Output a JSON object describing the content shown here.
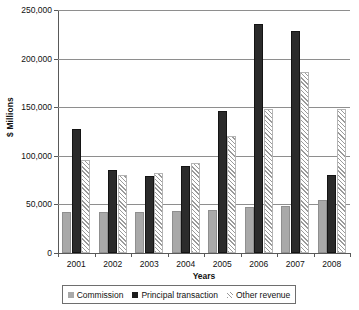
{
  "chart_data": {
    "type": "bar",
    "title": "",
    "xlabel": "Years",
    "ylabel": "$ Millions",
    "categories": [
      "2001",
      "2002",
      "2003",
      "2004",
      "2005",
      "2006",
      "2007",
      "2008"
    ],
    "series": [
      {
        "name": "Commission",
        "color": "#a9a9a9",
        "pattern": "solid-gray",
        "values": [
          42000,
          42000,
          42000,
          43000,
          44000,
          47000,
          48000,
          55000
        ]
      },
      {
        "name": "Principal transaction",
        "color": "#2b2b2b",
        "pattern": "solid-black",
        "values": [
          128000,
          85000,
          79000,
          90000,
          146000,
          236000,
          228000,
          80000
        ]
      },
      {
        "name": "Other revenue",
        "color": "#9a9a9a",
        "pattern": "diagonal-hatch",
        "values": [
          96000,
          80000,
          82000,
          93000,
          120000,
          148000,
          186000,
          148000
        ]
      }
    ],
    "ylim": [
      0,
      250000
    ],
    "ytick_values": [
      0,
      50000,
      100000,
      150000,
      200000,
      250000
    ],
    "ytick_labels": [
      "0",
      "50,000",
      "100,000",
      "150,000",
      "200,000",
      "250,000"
    ],
    "grid": true,
    "grid_axis": "y",
    "legend_position": "bottom",
    "legend": [
      "Commission",
      "Principal transaction",
      "Other revenue"
    ]
  }
}
